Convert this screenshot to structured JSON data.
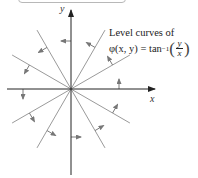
{
  "diagram": {
    "title_lines": [
      "Level curves of"
    ],
    "formula": {
      "lhs": "φ(x, y) = tan",
      "exponent": "−1",
      "numerator": "y",
      "denominator": "x",
      "open_paren": "(",
      "close_paren": ")"
    },
    "axes": {
      "x_label": "x",
      "y_label": "y"
    },
    "level_curve_angles_deg": [
      30,
      60,
      90,
      120,
      150,
      210,
      240,
      270,
      300,
      330
    ],
    "arrow_direction": "counterclockwise",
    "colors": {
      "lines": "#9a9a9a",
      "arrows": "#7a7a7a",
      "axes": "#222222"
    }
  }
}
